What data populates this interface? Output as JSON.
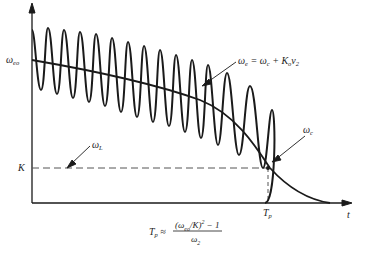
{
  "diagram": {
    "title": "",
    "axes": {
      "x_label": "t",
      "y_labels": {
        "omega_eo": {
          "main": "ω",
          "sub": "eo"
        },
        "K": "K"
      },
      "x_tick": {
        "main": "T",
        "sub": "p"
      }
    },
    "annotations": {
      "omega_e": {
        "text_main": "ω",
        "text_sub": "e",
        "rest": " = ω",
        "rest_sub": "c",
        "rest2": " + K",
        "rest2_sub": "o",
        "rest3": "v",
        "rest3_sub": "2"
      },
      "omega_c": {
        "main": "ω",
        "sub": "c"
      },
      "omega_L": {
        "main": "ω",
        "sub": "L"
      }
    },
    "formula": {
      "lhs_main": "T",
      "lhs_sub": "p",
      "approx": " ≈ ",
      "numerator_pre": "(ω",
      "numerator_sub": "eo",
      "numerator_post": "/K)",
      "numerator_sup": "2",
      "numerator_tail": " − 1",
      "denominator_main": "ω",
      "denominator_sub": "2"
    },
    "colors": {
      "ink": "#1a1a1a",
      "dashed": "#555555"
    }
  }
}
